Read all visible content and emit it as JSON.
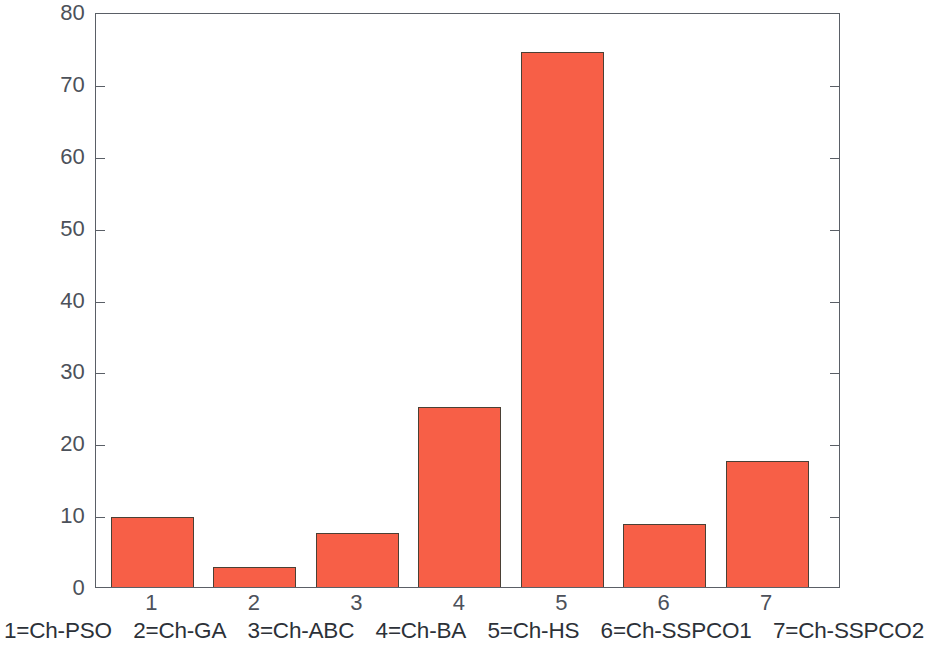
{
  "chart_data": {
    "type": "bar",
    "title": "",
    "xlabel": "",
    "ylabel": "",
    "categories": [
      "1",
      "2",
      "3",
      "4",
      "5",
      "6",
      "7"
    ],
    "values": [
      9.7,
      2.8,
      7.5,
      25.0,
      74.5,
      8.7,
      17.5
    ],
    "series": [
      {
        "name": "Ch",
        "values": [
          9.7,
          2.8,
          7.5,
          25.0,
          74.5,
          8.7,
          17.5
        ]
      }
    ],
    "ylim": [
      0,
      80
    ],
    "ytick_values": [
      0,
      10,
      20,
      30,
      40,
      50,
      60,
      70,
      80
    ],
    "ytick_labels": [
      "0",
      "10",
      "20",
      "30",
      "40",
      "50",
      "60",
      "70",
      "80"
    ],
    "xtick_labels": [
      "1",
      "2",
      "3",
      "4",
      "5",
      "6",
      "7"
    ],
    "grid": false,
    "legend_position": "below-axes",
    "bar_color": "#f75f47",
    "bar_edge_color": "#4a4035",
    "axis_color": "#5a5f66",
    "tick_label_color": "#4c515a",
    "background_color": "#ffffff"
  },
  "caption": {
    "items": [
      "1=Ch-PSO",
      "2=Ch-GA",
      "3=Ch-ABC",
      "4=Ch-BA",
      "5=Ch-HS",
      "6=Ch-SSPCO1",
      "7=Ch-SSPCO2"
    ]
  }
}
